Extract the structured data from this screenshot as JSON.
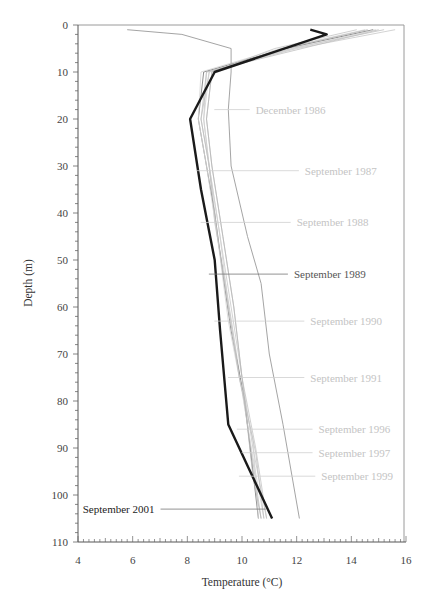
{
  "chart_data": {
    "type": "line",
    "title": "",
    "xlabel": "Temperature (°C)",
    "ylabel": "Depth (m)",
    "xlim": [
      4,
      16
    ],
    "ylim": [
      110,
      0
    ],
    "y_inverted": true,
    "grid": false,
    "xticks": [
      4,
      6,
      8,
      10,
      12,
      14,
      16
    ],
    "yticks": [
      0,
      10,
      20,
      30,
      40,
      50,
      60,
      70,
      80,
      90,
      100,
      110
    ],
    "series": [
      {
        "name": "December 1986",
        "color": "#9a9a9a",
        "width": 0.9,
        "points": [
          [
            5.8,
            1
          ],
          [
            7.8,
            2
          ],
          [
            9.6,
            5
          ],
          [
            9.6,
            10
          ],
          [
            9.5,
            18
          ],
          [
            9.6,
            30
          ],
          [
            10.2,
            45
          ],
          [
            10.7,
            55
          ],
          [
            11.0,
            70
          ],
          [
            11.5,
            85
          ],
          [
            12.1,
            105
          ]
        ],
        "label_pos": [
          10.5,
          18
        ]
      },
      {
        "name": "September 1987",
        "color": "#c8c8c8",
        "width": 0.8,
        "points": [
          [
            15.6,
            1
          ],
          [
            12.0,
            5
          ],
          [
            8.7,
            10
          ],
          [
            8.6,
            20
          ],
          [
            8.8,
            30
          ],
          [
            9.2,
            45
          ],
          [
            9.6,
            60
          ],
          [
            10.0,
            75
          ],
          [
            10.4,
            90
          ],
          [
            10.9,
            105
          ]
        ],
        "label_pos": [
          12.3,
          31
        ]
      },
      {
        "name": "September 1988",
        "color": "#c0c0c0",
        "width": 0.8,
        "points": [
          [
            15.2,
            1
          ],
          [
            11.8,
            5
          ],
          [
            8.8,
            10
          ],
          [
            8.5,
            20
          ],
          [
            8.8,
            30
          ],
          [
            9.0,
            42
          ],
          [
            9.4,
            55
          ],
          [
            9.8,
            70
          ],
          [
            10.2,
            85
          ],
          [
            10.7,
            105
          ]
        ],
        "label_pos": [
          12.0,
          42
        ]
      },
      {
        "name": "September 1989",
        "color": "#707070",
        "width": 0.8,
        "points": [
          [
            14.8,
            1
          ],
          [
            11.6,
            5
          ],
          [
            8.6,
            10
          ],
          [
            8.4,
            20
          ],
          [
            8.7,
            30
          ],
          [
            9.0,
            40
          ],
          [
            9.3,
            53
          ],
          [
            9.6,
            65
          ],
          [
            10.1,
            80
          ],
          [
            10.6,
            105
          ]
        ],
        "label_pos": [
          11.9,
          53
        ]
      },
      {
        "name": "September 1990",
        "color": "#d4d4d4",
        "width": 0.8,
        "points": [
          [
            14.5,
            1
          ],
          [
            11.4,
            5
          ],
          [
            8.5,
            10
          ],
          [
            8.4,
            20
          ],
          [
            8.7,
            30
          ],
          [
            9.1,
            45
          ],
          [
            9.5,
            63
          ],
          [
            10.0,
            78
          ],
          [
            10.4,
            92
          ],
          [
            10.8,
            105
          ]
        ],
        "label_pos": [
          12.5,
          63
        ]
      },
      {
        "name": "September 1991",
        "color": "#c4c4c4",
        "width": 0.8,
        "points": [
          [
            14.2,
            1
          ],
          [
            11.2,
            5
          ],
          [
            8.9,
            10
          ],
          [
            8.7,
            20
          ],
          [
            8.9,
            30
          ],
          [
            9.3,
            45
          ],
          [
            9.7,
            60
          ],
          [
            10.0,
            75
          ],
          [
            10.5,
            90
          ],
          [
            10.9,
            105
          ]
        ],
        "label_pos": [
          12.5,
          75
        ]
      },
      {
        "name": "September 1996",
        "color": "#d0d0d0",
        "width": 0.8,
        "points": [
          [
            14.9,
            1
          ],
          [
            11.9,
            5
          ],
          [
            8.8,
            10
          ],
          [
            8.6,
            20
          ],
          [
            8.8,
            30
          ],
          [
            9.2,
            45
          ],
          [
            9.5,
            60
          ],
          [
            9.9,
            75
          ],
          [
            10.4,
            88
          ],
          [
            10.6,
            105
          ]
        ],
        "label_pos": [
          12.8,
          86
        ]
      },
      {
        "name": "September 1997",
        "color": "#c0c0c0",
        "width": 0.8,
        "points": [
          [
            15.0,
            1
          ],
          [
            12.2,
            5
          ],
          [
            8.7,
            10
          ],
          [
            8.5,
            20
          ],
          [
            8.8,
            30
          ],
          [
            9.1,
            45
          ],
          [
            9.5,
            60
          ],
          [
            9.9,
            75
          ],
          [
            10.5,
            91
          ],
          [
            10.8,
            105
          ]
        ],
        "label_pos": [
          12.8,
          91
        ]
      },
      {
        "name": "September 1999",
        "color": "#b8b8b8",
        "width": 0.8,
        "points": [
          [
            14.6,
            1
          ],
          [
            11.5,
            5
          ],
          [
            8.9,
            10
          ],
          [
            8.7,
            20
          ],
          [
            8.9,
            30
          ],
          [
            9.3,
            45
          ],
          [
            9.7,
            60
          ],
          [
            10.0,
            75
          ],
          [
            10.4,
            96
          ],
          [
            10.7,
            105
          ]
        ],
        "label_pos": [
          12.9,
          96
        ]
      },
      {
        "name": "September 2001",
        "color": "#1a1a1a",
        "width": 2.4,
        "points": [
          [
            12.5,
            1
          ],
          [
            13.1,
            2
          ],
          [
            9.0,
            10
          ],
          [
            8.1,
            20
          ],
          [
            8.5,
            35
          ],
          [
            9.0,
            50
          ],
          [
            9.2,
            65
          ],
          [
            9.5,
            85
          ],
          [
            10.3,
            95
          ],
          [
            11.1,
            105
          ]
        ],
        "label_pos": [
          6.8,
          103
        ]
      }
    ]
  },
  "axes": {
    "xlabel": "Temperature (°C)",
    "ylabel": "Depth (m)"
  }
}
